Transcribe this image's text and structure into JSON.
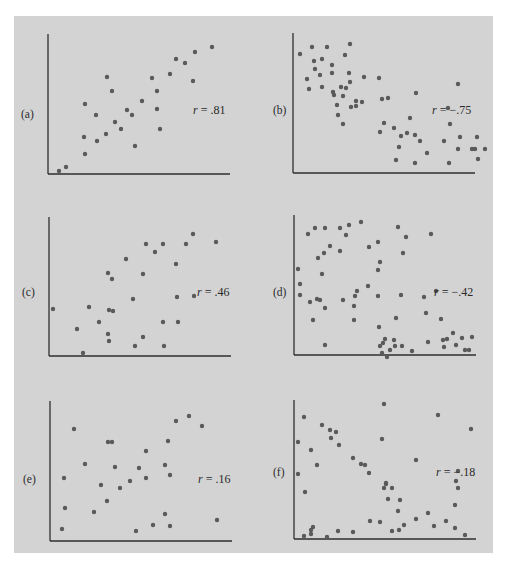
{
  "chart_data": [
    {
      "type": "scatter",
      "panel_label": "(a)",
      "annotation": "r = .81",
      "r": 0.81,
      "axes": {
        "origin": [
          48,
          174
        ],
        "top": 34,
        "right": 230
      },
      "label_pos": [
        21,
        118
      ],
      "annotation_pos": [
        193,
        114
      ],
      "points": [
        [
          59,
          171
        ],
        [
          66,
          167
        ],
        [
          85,
          154
        ],
        [
          84,
          137
        ],
        [
          85,
          104
        ],
        [
          96,
          115
        ],
        [
          97,
          141
        ],
        [
          106,
          134
        ],
        [
          107,
          77
        ],
        [
          112,
          91
        ],
        [
          115,
          122
        ],
        [
          121,
          129
        ],
        [
          127,
          110
        ],
        [
          132,
          115
        ],
        [
          135,
          146
        ],
        [
          142,
          101
        ],
        [
          152,
          78
        ],
        [
          157,
          91
        ],
        [
          157,
          109
        ],
        [
          160,
          129
        ],
        [
          170,
          74
        ],
        [
          176,
          59
        ],
        [
          185,
          63
        ],
        [
          193,
          81
        ],
        [
          195,
          52
        ],
        [
          212,
          47
        ]
      ],
      "xlabel": "",
      "ylabel": "",
      "grid": false
    },
    {
      "type": "scatter",
      "panel_label": "(b)",
      "annotation": "r = −.75",
      "r": -0.75,
      "axes": {
        "origin": [
          293,
          173
        ],
        "top": 33,
        "right": 475
      },
      "label_pos": [
        273,
        114
      ],
      "annotation_pos": [
        432,
        114
      ],
      "points": [
        [
          300,
          54
        ],
        [
          312,
          47
        ],
        [
          327,
          47
        ],
        [
          307,
          79
        ],
        [
          309,
          89
        ],
        [
          315,
          69
        ],
        [
          314,
          61
        ],
        [
          322,
          59
        ],
        [
          320,
          75
        ],
        [
          322,
          87
        ],
        [
          332,
          65
        ],
        [
          332,
          73
        ],
        [
          345,
          55
        ],
        [
          350,
          44
        ],
        [
          349,
          73
        ],
        [
          350,
          82
        ],
        [
          346,
          88
        ],
        [
          333,
          92
        ],
        [
          334,
          95
        ],
        [
          341,
          87
        ],
        [
          343,
          96
        ],
        [
          337,
          105
        ],
        [
          338,
          115
        ],
        [
          343,
          124
        ],
        [
          351,
          107
        ],
        [
          356,
          106
        ],
        [
          362,
          102
        ],
        [
          356,
          101
        ],
        [
          364,
          77
        ],
        [
          379,
          78
        ],
        [
          382,
          99
        ],
        [
          384,
          123
        ],
        [
          388,
          98
        ],
        [
          380,
          132
        ],
        [
          394,
          128
        ],
        [
          399,
          147
        ],
        [
          401,
          136
        ],
        [
          415,
          163
        ],
        [
          396,
          160
        ],
        [
          407,
          133
        ],
        [
          410,
          118
        ],
        [
          415,
          135
        ],
        [
          420,
          141
        ],
        [
          427,
          153
        ],
        [
          444,
          141
        ],
        [
          450,
          124
        ],
        [
          448,
          108
        ],
        [
          458,
          84
        ],
        [
          458,
          149
        ],
        [
          460,
          137
        ],
        [
          472,
          149
        ],
        [
          475,
          149
        ],
        [
          485,
          149
        ],
        [
          478,
          159
        ],
        [
          477,
          137
        ],
        [
          449,
          163
        ],
        [
          416,
          93
        ]
      ],
      "xlabel": "",
      "ylabel": "",
      "grid": false
    },
    {
      "type": "scatter",
      "panel_label": "(c)",
      "annotation": "r = .46",
      "r": 0.46,
      "axes": {
        "origin": [
          49,
          356
        ],
        "top": 217,
        "right": 231
      },
      "label_pos": [
        22,
        296
      ],
      "annotation_pos": [
        197,
        296
      ],
      "points": [
        [
          53,
          309
        ],
        [
          77,
          329
        ],
        [
          83,
          353
        ],
        [
          89,
          307
        ],
        [
          99,
          322
        ],
        [
          109,
          341
        ],
        [
          108,
          334
        ],
        [
          112,
          279
        ],
        [
          108,
          273
        ],
        [
          113,
          311
        ],
        [
          126,
          259
        ],
        [
          133,
          299
        ],
        [
          143,
          274
        ],
        [
          143,
          337
        ],
        [
          135,
          346
        ],
        [
          146,
          244
        ],
        [
          163,
          244
        ],
        [
          163,
          322
        ],
        [
          164,
          346
        ],
        [
          176,
          264
        ],
        [
          177,
          297
        ],
        [
          178,
          322
        ],
        [
          186,
          244
        ],
        [
          194,
          296
        ],
        [
          216,
          242
        ],
        [
          193,
          234
        ],
        [
          155,
          252
        ],
        [
          109,
          310
        ]
      ],
      "xlabel": "",
      "ylabel": "",
      "grid": false
    },
    {
      "type": "scatter",
      "panel_label": "(d)",
      "annotation": "r = −.42",
      "r": -0.42,
      "axes": {
        "origin": [
          294,
          355
        ],
        "top": 215,
        "right": 476
      },
      "label_pos": [
        273,
        296
      ],
      "annotation_pos": [
        434,
        296
      ],
      "points": [
        [
          298,
          269
        ],
        [
          300,
          284
        ],
        [
          300,
          295
        ],
        [
          308,
          234
        ],
        [
          310,
          302
        ],
        [
          313,
          320
        ],
        [
          315,
          228
        ],
        [
          317,
          299
        ],
        [
          320,
          300
        ],
        [
          318,
          258
        ],
        [
          322,
          274
        ],
        [
          324,
          253
        ],
        [
          325,
          308
        ],
        [
          325,
          345
        ],
        [
          325,
          228
        ],
        [
          330,
          246
        ],
        [
          340,
          228
        ],
        [
          340,
          251
        ],
        [
          343,
          300
        ],
        [
          346,
          235
        ],
        [
          349,
          225
        ],
        [
          354,
          320
        ],
        [
          354,
          306
        ],
        [
          355,
          296
        ],
        [
          357,
          291
        ],
        [
          361,
          222
        ],
        [
          369,
          247
        ],
        [
          368,
          286
        ],
        [
          378,
          270
        ],
        [
          378,
          242
        ],
        [
          378,
          296
        ],
        [
          379,
          327
        ],
        [
          380,
          346
        ],
        [
          382,
          353
        ],
        [
          380,
          262
        ],
        [
          383,
          343
        ],
        [
          385,
          339
        ],
        [
          387,
          357
        ],
        [
          390,
          350
        ],
        [
          394,
          340
        ],
        [
          395,
          346
        ],
        [
          396,
          318
        ],
        [
          398,
          227
        ],
        [
          401,
          295
        ],
        [
          403,
          253
        ],
        [
          406,
          237
        ],
        [
          412,
          351
        ],
        [
          402,
          346
        ],
        [
          424,
          297
        ],
        [
          431,
          234
        ],
        [
          426,
          313
        ],
        [
          428,
          342
        ],
        [
          436,
          291
        ],
        [
          441,
          319
        ],
        [
          443,
          340
        ],
        [
          444,
          347
        ],
        [
          447,
          339
        ],
        [
          453,
          333
        ],
        [
          456,
          345
        ],
        [
          462,
          338
        ],
        [
          465,
          350
        ],
        [
          469,
          350
        ],
        [
          472,
          337
        ]
      ],
      "xlabel": "",
      "ylabel": "",
      "grid": false
    },
    {
      "type": "scatter",
      "panel_label": "(e)",
      "annotation": "r = .16",
      "r": 0.16,
      "axes": {
        "origin": [
          50,
          541
        ],
        "top": 401,
        "right": 232
      },
      "label_pos": [
        23,
        483
      ],
      "annotation_pos": [
        198,
        483
      ],
      "points": [
        [
          62,
          529
        ],
        [
          64,
          478
        ],
        [
          65,
          508
        ],
        [
          74,
          429
        ],
        [
          85,
          464
        ],
        [
          94,
          512
        ],
        [
          101,
          485
        ],
        [
          107,
          501
        ],
        [
          112,
          442
        ],
        [
          115,
          467
        ],
        [
          120,
          488
        ],
        [
          130,
          481
        ],
        [
          136,
          531
        ],
        [
          139,
          468
        ],
        [
          146,
          451
        ],
        [
          146,
          478
        ],
        [
          153,
          525
        ],
        [
          165,
          514
        ],
        [
          165,
          465
        ],
        [
          168,
          441
        ],
        [
          170,
          526
        ],
        [
          176,
          421
        ],
        [
          189,
          416
        ],
        [
          202,
          426
        ],
        [
          217,
          520
        ],
        [
          170,
          475
        ],
        [
          108,
          442
        ]
      ],
      "xlabel": "",
      "ylabel": "",
      "grid": false
    },
    {
      "type": "scatter",
      "panel_label": "(f)",
      "annotation": "r = −.18",
      "r": -0.18,
      "axes": {
        "origin": [
          294,
          539
        ],
        "top": 400,
        "right": 476
      },
      "label_pos": [
        273,
        476
      ],
      "annotation_pos": [
        436,
        476
      ],
      "points": [
        [
          298,
          442
        ],
        [
          298,
          474
        ],
        [
          304,
          417
        ],
        [
          305,
          492
        ],
        [
          304,
          536
        ],
        [
          311,
          530
        ],
        [
          311,
          534
        ],
        [
          311,
          450
        ],
        [
          313,
          527
        ],
        [
          317,
          465
        ],
        [
          322,
          425
        ],
        [
          327,
          537
        ],
        [
          330,
          430
        ],
        [
          331,
          438
        ],
        [
          336,
          432
        ],
        [
          338,
          531
        ],
        [
          339,
          445
        ],
        [
          353,
          532
        ],
        [
          353,
          458
        ],
        [
          361,
          464
        ],
        [
          365,
          465
        ],
        [
          370,
          521
        ],
        [
          369,
          473
        ],
        [
          380,
          522
        ],
        [
          384,
          488
        ],
        [
          384,
          404
        ],
        [
          382,
          439
        ],
        [
          386,
          483
        ],
        [
          386,
          484
        ],
        [
          388,
          499
        ],
        [
          392,
          531
        ],
        [
          392,
          488
        ],
        [
          400,
          500
        ],
        [
          398,
          511
        ],
        [
          399,
          530
        ],
        [
          404,
          525
        ],
        [
          416,
          460
        ],
        [
          416,
          519
        ],
        [
          428,
          513
        ],
        [
          434,
          526
        ],
        [
          438,
          415
        ],
        [
          446,
          521
        ],
        [
          455,
          505
        ],
        [
          456,
          481
        ],
        [
          455,
          528
        ],
        [
          458,
          471
        ],
        [
          458,
          488
        ],
        [
          471,
          429
        ],
        [
          465,
          535
        ]
      ],
      "xlabel": "",
      "ylabel": "",
      "grid": false
    }
  ],
  "figure": {
    "background_color": "#d3d3d3",
    "point_color": "#5a5a5a",
    "axis_color": "#2e2e2e"
  }
}
